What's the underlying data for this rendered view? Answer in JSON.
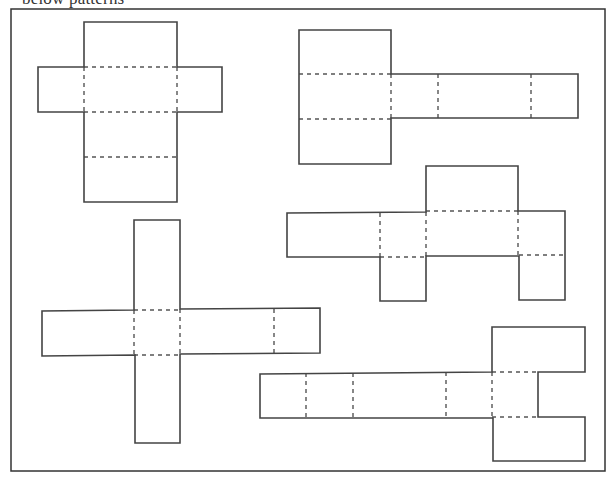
{
  "caption": "below patterns",
  "figure": {
    "frame": {
      "x": 11,
      "y": 9,
      "width": 594,
      "height": 462
    },
    "colors": {
      "stroke": "#444444",
      "fold_line": "#555555",
      "background": "#ffffff"
    },
    "nets": [
      {
        "id": "net-1",
        "description": "Cross-shaped net: tall center column with two side flaps",
        "outline": "M84,22 L177,22 L177,67 L222,67 L222,112 L177,112 L177,202 L84,202 L84,112 L38,112 L38,67 L84,67 Z",
        "folds": [
          "M84,67 L177,67",
          "M84,112 L177,112",
          "M84,157 L177,157",
          "M84,67 L84,112",
          "M177,67 L177,112"
        ]
      },
      {
        "id": "net-2",
        "description": "Tall square column on left with a long horizontal strip extending right",
        "outline": "M299,30 L391,30 L391,74 L578,74 L578,118 L391,118 L391,164 L299,164 L299,118 L299,74 Z",
        "folds": [
          "M299,74 L391,74",
          "M299,119 L391,119",
          "M391,74 L391,118",
          "M438,74 L438,118",
          "M531,74 L531,118"
        ]
      },
      {
        "id": "net-3",
        "description": "Horizontal strip with top flap and two bottom flaps",
        "outline": "M287,213 L426,212 L426,166 L518,166 L518,211 L565,211 L565,300 L519,300 L519,256 L426,256 L426,301 L380,301 L380,257 L287,257 Z",
        "folds": [
          "M380,213 L380,257",
          "M426,212 L426,256",
          "M426,211 L518,211",
          "M380,257 L426,257",
          "M518,211 L518,256",
          "M519,255 L565,255"
        ]
      },
      {
        "id": "net-4",
        "description": "Plus-shaped net: vertical bar crossing a horizontal bar",
        "outline": "M134,220 L180,220 L180,309 L320,308 L320,353 L180,354 L180,443 L135,443 L135,355 L42,356 L42,311 L134,310 Z",
        "folds": [
          "M134,310 L180,310",
          "M134,355 L180,355",
          "M134,310 L134,355",
          "M180,309 L180,354",
          "M274,309 L274,353"
        ]
      },
      {
        "id": "net-5",
        "description": "Long horizontal strip ending in a C-shaped bracket of flaps on the right",
        "outline": "M260,374 L492,372 L492,327 L585,327 L585,372 L538,372 L538,417 L585,417 L585,461 L493,461 L493,418 L260,418 Z",
        "folds": [
          "M306,373 L306,418",
          "M353,373 L353,418",
          "M446,372 L446,417",
          "M492,372 L492,417",
          "M492,372 L538,372",
          "M492,417 L538,417"
        ]
      }
    ]
  }
}
